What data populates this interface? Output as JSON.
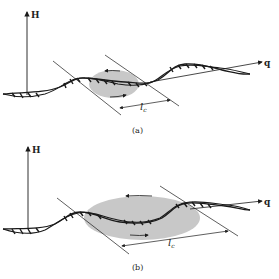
{
  "figure": {
    "panels": [
      {
        "id": "a",
        "caption": "(a)",
        "y_axis_label": "H",
        "x_axis_label": "q",
        "length_label": "l",
        "length_subscript": "c",
        "ellipse_size": "small"
      },
      {
        "id": "b",
        "caption": "(b)",
        "y_axis_label": "H",
        "x_axis_label": "q",
        "length_label": "l",
        "length_subscript": "c",
        "ellipse_size": "large"
      }
    ],
    "colors": {
      "line": "#1a1a1a",
      "ellipse_fill": "#c8c8c8",
      "background": "#ffffff"
    }
  }
}
